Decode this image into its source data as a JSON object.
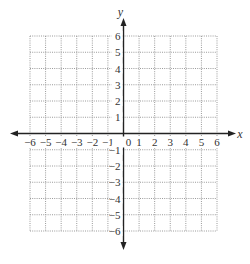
{
  "chart_data": {
    "type": "coordinate-grid",
    "title": "",
    "xlabel": "x",
    "ylabel": "y",
    "xlim": [
      -6,
      6
    ],
    "ylim": [
      -6,
      6
    ],
    "grid": true,
    "grid_style": "dotted",
    "x_ticks": [
      "-6",
      "-5",
      "-4",
      "-3",
      "-2",
      "-1",
      "0",
      "1",
      "2",
      "3",
      "4",
      "5",
      "6"
    ],
    "y_ticks": [
      "6",
      "5",
      "4",
      "3",
      "2",
      "1",
      "-1",
      "-2",
      "-3",
      "-4",
      "-5",
      "-6"
    ],
    "data": []
  },
  "colors": {
    "axis": "#222222",
    "grid": "#9a9a9a",
    "label": "#333333"
  }
}
